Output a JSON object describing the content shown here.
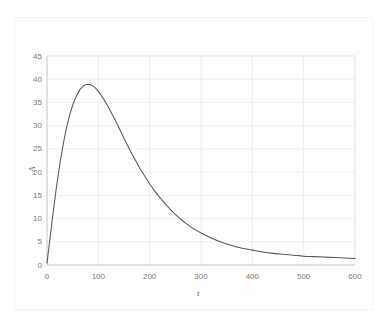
{
  "chart_data": {
    "type": "line",
    "title": "",
    "subtitle": "",
    "xlabel": "t",
    "ylabel": "A",
    "xlim": [
      0,
      600
    ],
    "ylim": [
      0,
      45
    ],
    "xticks": [
      0,
      100,
      200,
      300,
      400,
      500,
      600
    ],
    "yticks": [
      0,
      5,
      10,
      15,
      20,
      25,
      30,
      35,
      40,
      45
    ],
    "grid": true,
    "legend": null,
    "legend_position": "none",
    "annotations": [],
    "series": [
      {
        "name": "A",
        "color": "#595959",
        "x": [
          0,
          10,
          20,
          30,
          40,
          50,
          60,
          70,
          80,
          90,
          100,
          110,
          120,
          130,
          140,
          150,
          160,
          170,
          180,
          190,
          200,
          210,
          220,
          230,
          240,
          250,
          260,
          270,
          280,
          290,
          300,
          320,
          340,
          360,
          380,
          400,
          420,
          440,
          460,
          480,
          500,
          520,
          540,
          560,
          580,
          600
        ],
        "y": [
          0.4,
          9.5,
          18.0,
          25.0,
          30.5,
          34.4,
          37.0,
          38.5,
          38.9,
          38.5,
          37.4,
          35.8,
          33.9,
          31.8,
          29.6,
          27.3,
          25.1,
          23.0,
          21.0,
          19.2,
          17.5,
          15.9,
          14.5,
          13.2,
          12.0,
          10.9,
          9.9,
          9.0,
          8.2,
          7.5,
          6.9,
          5.8,
          4.9,
          4.2,
          3.6,
          3.2,
          2.8,
          2.5,
          2.3,
          2.1,
          1.9,
          1.8,
          1.7,
          1.6,
          1.5,
          1.4
        ]
      }
    ]
  },
  "axes": {
    "y_tick_labels": [
      "45",
      "40",
      "35",
      "30",
      "25",
      "20",
      "15",
      "10",
      "5",
      "0"
    ],
    "x_tick_labels": [
      "0",
      "100",
      "200",
      "300",
      "400",
      "500",
      "600"
    ],
    "y_axis_title": "A",
    "x_axis_title": "t"
  },
  "colors": {
    "series_line": "#595959",
    "gridline": "#e9e9e9",
    "axis_line": "#bfbfbf",
    "tick_text": "#7a7a7a",
    "plot_background": "#ffffff",
    "figure_background": "#ffffff",
    "outer_frame": "#f4f4f4"
  }
}
